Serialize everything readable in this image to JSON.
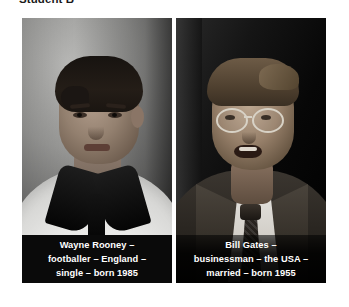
{
  "heading": "Student B",
  "colors": {
    "page_background": "#ffffff",
    "heading_text": "#1a1a1a",
    "caption_background": "#0a0a0a",
    "caption_text": "#ffffff"
  },
  "photos": [
    {
      "id": "wayne-rooney",
      "alt": "Black and white photo of a young footballer in a white England rugby-style shirt with black collar",
      "badge_text": "ENGLAND",
      "caption": "Wayne Rooney – footballer – England – single – born 1985",
      "caption_lines": [
        "Wayne Rooney –",
        "footballer – England –",
        "single – born 1985"
      ],
      "facts": {
        "name": "Wayne Rooney",
        "job": "footballer",
        "country": "England",
        "marital_status": "single",
        "born": "1985"
      }
    },
    {
      "id": "bill-gates",
      "alt": "Black and white photo of a man with glasses in a dark suit and tie, speaking",
      "caption": "Bill Gates – businessman – the USA – married – born 1955",
      "caption_lines": [
        "Bill Gates –",
        "businessman – the USA –",
        "married – born 1955"
      ],
      "facts": {
        "name": "Bill Gates",
        "job": "businessman",
        "country": "the USA",
        "marital_status": "married",
        "born": "1955"
      }
    }
  ]
}
